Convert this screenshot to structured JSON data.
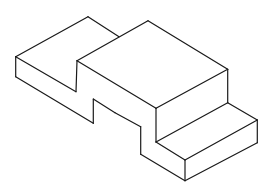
{
  "figure": {
    "type": "isometric-line-drawing",
    "stroke_color": "#1a1a1a",
    "background_color": "#ffffff",
    "parts": [
      {
        "name": "left-block",
        "edges": [
          [
            [
              15.7,
              56.7
            ],
            [
              88,
              16.7
            ]
          ],
          [
            [
              88,
              16.7
            ],
            [
              119,
              36.7
            ]
          ],
          [
            [
              15.7,
              56.7
            ],
            [
              76,
              91.7
            ]
          ],
          [
            [
              76,
              91.7
            ],
            [
              77,
              60.7
            ]
          ],
          [
            [
              15.7,
              56.7
            ],
            [
              15.7,
              76.7
            ]
          ],
          [
            [
              15.7,
              76.7
            ],
            [
              93.3,
              123.3
            ]
          ],
          [
            [
              93.3,
              123.3
            ],
            [
              93.3,
              99
            ]
          ],
          [
            [
              93.3,
              99
            ],
            [
              115,
              112.7
            ]
          ]
        ]
      },
      {
        "name": "center-block",
        "edges": [
          [
            [
              77,
              60.7
            ],
            [
              148,
              20.7
            ]
          ],
          [
            [
              148,
              20.7
            ],
            [
              227.7,
              69.3
            ]
          ],
          [
            [
              227.7,
              69.3
            ],
            [
              156,
              108.3
            ]
          ],
          [
            [
              156,
              108.3
            ],
            [
              77,
              60.7
            ]
          ],
          [
            [
              227.7,
              69.3
            ],
            [
              227.7,
              102.7
            ]
          ],
          [
            [
              156,
              108.3
            ],
            [
              156,
              142
            ]
          ],
          [
            [
              115,
              112.7
            ],
            [
              140.7,
              126.7
            ]
          ],
          [
            [
              140.7,
              126.7
            ],
            [
              140.7,
              154.3
            ]
          ],
          [
            [
              140.7,
              154.3
            ],
            [
              185,
              180.7
            ]
          ]
        ]
      },
      {
        "name": "front-step",
        "edges": [
          [
            [
              156,
              142
            ],
            [
              227.7,
              102.7
            ]
          ],
          [
            [
              227.7,
              102.7
            ],
            [
              257.3,
              120
            ]
          ],
          [
            [
              257.3,
              120
            ],
            [
              185,
              160
            ]
          ],
          [
            [
              185,
              160
            ],
            [
              156,
              142
            ]
          ],
          [
            [
              257.3,
              120
            ],
            [
              257.3,
              142.7
            ]
          ],
          [
            [
              257.3,
              142.7
            ],
            [
              185,
              180.7
            ]
          ],
          [
            [
              185,
              160
            ],
            [
              185,
              180.7
            ]
          ]
        ]
      }
    ]
  }
}
